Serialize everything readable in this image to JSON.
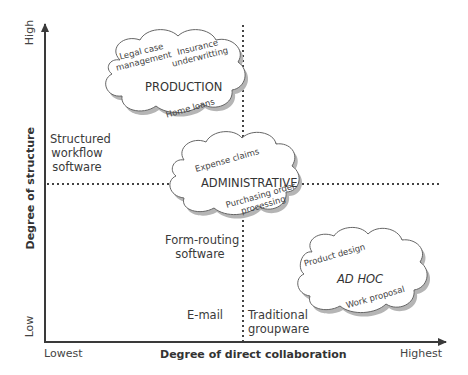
{
  "diagram": {
    "type": "quadrant-map",
    "y_axis": {
      "title": "Degree of structure",
      "low_label": "Low",
      "high_label": "High"
    },
    "x_axis": {
      "title": "Degree of direct collaboration",
      "low_label": "Lowest",
      "high_label": "Highest"
    },
    "quadrant_labels": {
      "structured_workflow": "Structured\nworkflow\nsoftware",
      "structured_workflow_lines": [
        "Structured",
        "workflow",
        "software"
      ],
      "form_routing_lines": [
        "Form-routing",
        "software"
      ],
      "email": "E-mail",
      "traditional_groupware_lines": [
        "Traditional",
        "groupware"
      ]
    },
    "clouds": [
      {
        "title": "PRODUCTION",
        "italic": false,
        "examples": [
          "Legal case management",
          "Insurance underwritting",
          "Home loans"
        ],
        "example_lines": {
          "legal": [
            "Legal case",
            "management"
          ],
          "insurance": [
            "Insurance",
            "underwritting"
          ],
          "home": "Home loans"
        }
      },
      {
        "title": "ADMINISTRATIVE",
        "italic": false,
        "examples": [
          "Expense claims",
          "Purchasing order processing"
        ],
        "example_lines": {
          "expense": "Expense claims",
          "purchasing": [
            "Purchasing order",
            "processing"
          ]
        }
      },
      {
        "title": "AD HOC",
        "italic": true,
        "examples": [
          "Product design",
          "Work proposal"
        ],
        "example_lines": {
          "product": "Product design",
          "work": "Work proposal"
        }
      }
    ],
    "colors": {
      "axis": "#3a3a3a",
      "cloud_stroke": "#666666",
      "cloud_shadow": "#aaaaaa",
      "text": "#333333",
      "dotted": "#444444"
    }
  }
}
